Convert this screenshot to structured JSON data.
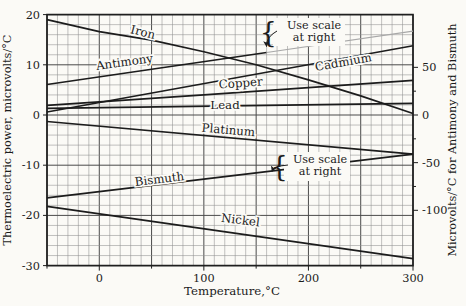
{
  "figure": {
    "background": "#fbfaf6",
    "ink_color": "#1c1c1c",
    "grid_minor_color": "#8f8f8f",
    "grid_major_color": "#4a4a4a",
    "faint_line_color": "#a8a8a8"
  },
  "chart_data": {
    "type": "line",
    "title": "",
    "xlabel": "Temperature,°C",
    "ylabel_left": "Thermoelectric power, microvolts/°C",
    "ylabel_right": "Microvolts/°C for Antimony and Bismuth",
    "x_range": [
      -50,
      300
    ],
    "ylim_left": [
      -30,
      20
    ],
    "grid": "on",
    "x_ticks": [
      {
        "label": "0",
        "t": 0
      },
      {
        "label": "100",
        "t": 100
      },
      {
        "label": "200",
        "t": 200
      },
      {
        "label": "300",
        "t": 300
      }
    ],
    "y_ticks_left": [
      {
        "label": "20",
        "v": 20
      },
      {
        "label": "10",
        "v": 10
      },
      {
        "label": "0",
        "v": 0
      },
      {
        "label": "-10",
        "v": -10
      },
      {
        "label": "-20",
        "v": -20
      },
      {
        "label": "-30",
        "v": -30
      }
    ],
    "y_ticks_right": [
      {
        "label": "50",
        "r": 50
      },
      {
        "label": "0",
        "r": 0
      },
      {
        "label": "-50",
        "r": -50
      },
      {
        "label": "-100",
        "r": -100
      }
    ],
    "series": [
      {
        "id": "iron",
        "name": "Iron",
        "scale": "left",
        "points": [
          [
            -50,
            19.0
          ],
          [
            0,
            16.6
          ],
          [
            50,
            14.9
          ],
          [
            100,
            12.6
          ],
          [
            150,
            10.0
          ],
          [
            200,
            7.0
          ],
          [
            250,
            3.8
          ],
          [
            300,
            0.3
          ]
        ]
      },
      {
        "id": "antimony",
        "name": "Antimony",
        "scale": "right",
        "points": [
          [
            -50,
            32
          ],
          [
            160,
            65.6
          ],
          [
            300,
            88
          ]
        ],
        "faint_from": 160
      },
      {
        "id": "cadmium",
        "name": "Cadmium",
        "scale": "left",
        "points": [
          [
            -50,
            0.6
          ],
          [
            300,
            13.8
          ]
        ]
      },
      {
        "id": "copper",
        "name": "Copper",
        "scale": "left",
        "points": [
          [
            -50,
            1.9
          ],
          [
            100,
            4.0
          ],
          [
            300,
            6.9
          ]
        ]
      },
      {
        "id": "lead",
        "name": "Lead",
        "scale": "left",
        "points": [
          [
            -50,
            1.3
          ],
          [
            300,
            2.3
          ]
        ]
      },
      {
        "id": "platinum",
        "name": "Platinum",
        "scale": "left",
        "points": [
          [
            -50,
            -1.3
          ],
          [
            300,
            -7.8
          ]
        ]
      },
      {
        "id": "bismuth",
        "name": "Bismuth",
        "scale": "right",
        "points": [
          [
            -50,
            -87
          ],
          [
            300,
            -41
          ]
        ]
      },
      {
        "id": "nickel",
        "name": "Nickel",
        "scale": "left",
        "points": [
          [
            -50,
            -18.2
          ],
          [
            300,
            -28.6
          ]
        ]
      }
    ],
    "annotations": [
      {
        "id": "note-top",
        "line1": "Use scale",
        "line2": "at right",
        "target": "antimony"
      },
      {
        "id": "note-bottom",
        "line1": "Use scale",
        "line2": "at right",
        "target": "bismuth"
      }
    ]
  }
}
